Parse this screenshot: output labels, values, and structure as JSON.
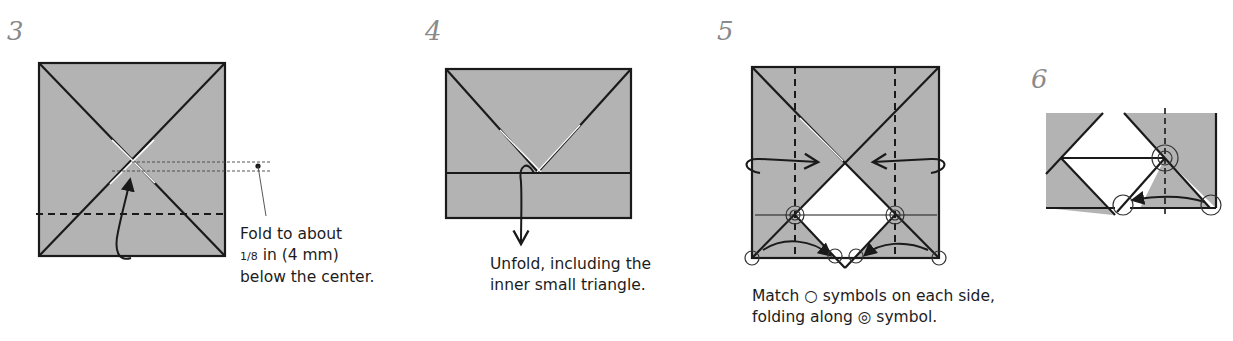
{
  "steps": [
    {
      "number": "3",
      "caption": {
        "line1": "Fold to about",
        "fraction": "1/8",
        "line2_rest": " in (4 mm)",
        "line3": "below the center."
      }
    },
    {
      "number": "4",
      "caption": {
        "line1": "Unfold, including the",
        "line2": "inner small triangle."
      }
    },
    {
      "number": "5",
      "caption": {
        "line1": "Match ○ symbols on each side,",
        "line2": "folding along ◎ symbol."
      }
    },
    {
      "number": "6"
    }
  ],
  "colors": {
    "paper": "#b3b3b3",
    "line": "#1a1a1a",
    "step_number": "#8a8a8a",
    "text": "#1c1c1c"
  },
  "icons": {
    "match_symbol": "circle-icon",
    "fold_point_symbol": "bullseye-icon"
  }
}
